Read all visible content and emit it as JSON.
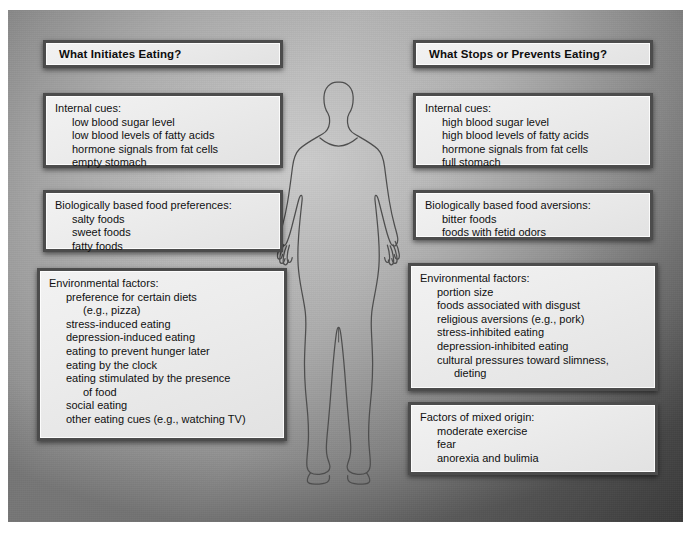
{
  "diagram": {
    "figure_label": "human-body-silhouette",
    "colors": {
      "background_gray": "#a0a0a0",
      "box_fill": "#ececec",
      "box_border": "#4c4c4c",
      "text": "#101010",
      "figure_outline": "#4a4a4a"
    }
  },
  "columns": {
    "left": {
      "header": "What Initiates Eating?",
      "groups": [
        {
          "title": "Internal cues:",
          "items": [
            {
              "text": "low blood sugar level",
              "continuation": false
            },
            {
              "text": "low blood levels of fatty acids",
              "continuation": false
            },
            {
              "text": "hormone signals from fat cells",
              "continuation": false
            },
            {
              "text": "empty stomach",
              "continuation": false
            }
          ]
        },
        {
          "title": "Biologically based food preferences:",
          "items": [
            {
              "text": "salty foods",
              "continuation": false
            },
            {
              "text": "sweet foods",
              "continuation": false
            },
            {
              "text": "fatty foods",
              "continuation": false
            }
          ]
        },
        {
          "title": "Environmental factors:",
          "items": [
            {
              "text": "preference for certain diets",
              "continuation": false
            },
            {
              "text": "(e.g., pizza)",
              "continuation": true
            },
            {
              "text": "stress-induced eating",
              "continuation": false
            },
            {
              "text": "depression-induced eating",
              "continuation": false
            },
            {
              "text": "eating to prevent hunger later",
              "continuation": false
            },
            {
              "text": "eating by the clock",
              "continuation": false
            },
            {
              "text": "eating stimulated by the presence",
              "continuation": false
            },
            {
              "text": "of food",
              "continuation": true
            },
            {
              "text": "social eating",
              "continuation": false
            },
            {
              "text": "other eating cues (e.g., watching TV)",
              "continuation": false
            }
          ]
        }
      ]
    },
    "right": {
      "header": "What Stops or Prevents Eating?",
      "groups": [
        {
          "title": "Internal cues:",
          "items": [
            {
              "text": "high blood sugar level",
              "continuation": false
            },
            {
              "text": "high blood levels of fatty acids",
              "continuation": false
            },
            {
              "text": "hormone signals from fat cells",
              "continuation": false
            },
            {
              "text": "full stomach",
              "continuation": false
            }
          ]
        },
        {
          "title": "Biologically based food aversions:",
          "items": [
            {
              "text": "bitter foods",
              "continuation": false
            },
            {
              "text": "foods with fetid odors",
              "continuation": false
            }
          ]
        },
        {
          "title": "Environmental factors:",
          "items": [
            {
              "text": "portion size",
              "continuation": false
            },
            {
              "text": "foods associated with disgust",
              "continuation": false
            },
            {
              "text": "religious aversions (e.g., pork)",
              "continuation": false
            },
            {
              "text": "stress-inhibited eating",
              "continuation": false
            },
            {
              "text": "depression-inhibited eating",
              "continuation": false
            },
            {
              "text": "cultural pressures toward slimness,",
              "continuation": false
            },
            {
              "text": "dieting",
              "continuation": true
            }
          ]
        },
        {
          "title": "Factors of mixed origin:",
          "items": [
            {
              "text": "moderate exercise",
              "continuation": false
            },
            {
              "text": "fear",
              "continuation": false
            },
            {
              "text": "anorexia and bulimia",
              "continuation": false
            }
          ]
        }
      ]
    }
  }
}
